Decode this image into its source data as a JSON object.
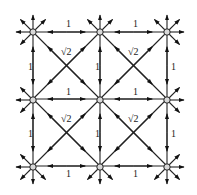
{
  "diagram": {
    "type": "grid-graph",
    "grid": {
      "rows": 3,
      "cols": 3,
      "spacing": 67,
      "origin": [
        33,
        32
      ],
      "outer_arrow_length": 17
    },
    "nodes": [
      {
        "id": "n00",
        "x": 33,
        "y": 32
      },
      {
        "id": "n01",
        "x": 100,
        "y": 32
      },
      {
        "id": "n02",
        "x": 167,
        "y": 32
      },
      {
        "id": "n10",
        "x": 33,
        "y": 100
      },
      {
        "id": "n11",
        "x": 100,
        "y": 100
      },
      {
        "id": "n12",
        "x": 167,
        "y": 100
      },
      {
        "id": "n20",
        "x": 33,
        "y": 167
      },
      {
        "id": "n21",
        "x": 100,
        "y": 167
      },
      {
        "id": "n22",
        "x": 167,
        "y": 167
      }
    ],
    "labels": {
      "unit": "1",
      "diagonal": "√2"
    },
    "edge_labels": [
      {
        "text": "1",
        "x": 66,
        "y": 27
      },
      {
        "text": "1",
        "x": 133,
        "y": 27
      },
      {
        "text": "1",
        "x": 66,
        "y": 95
      },
      {
        "text": "1",
        "x": 133,
        "y": 95
      },
      {
        "text": "1",
        "x": 66,
        "y": 177
      },
      {
        "text": "1",
        "x": 133,
        "y": 177
      },
      {
        "text": "1",
        "x": 28,
        "y": 70
      },
      {
        "text": "1",
        "x": 28,
        "y": 137
      },
      {
        "text": "1",
        "x": 95,
        "y": 70
      },
      {
        "text": "1",
        "x": 95,
        "y": 137
      },
      {
        "text": "1",
        "x": 171,
        "y": 70
      },
      {
        "text": "1",
        "x": 171,
        "y": 137
      },
      {
        "text": "√2",
        "x": 61,
        "y": 55
      },
      {
        "text": "√2",
        "x": 128,
        "y": 55
      },
      {
        "text": "√2",
        "x": 61,
        "y": 122
      },
      {
        "text": "√2",
        "x": 128,
        "y": 122
      }
    ],
    "colors": {
      "line": "#222222",
      "node_fill": "#d8d8d8",
      "arrow": "#111111",
      "background": "#ffffff"
    }
  }
}
